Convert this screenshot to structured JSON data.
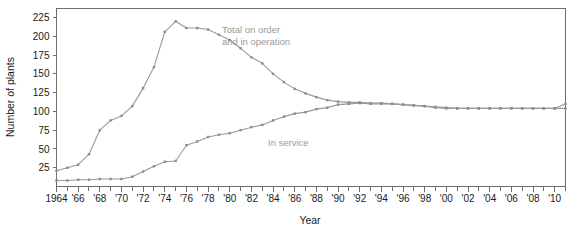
{
  "chart_data": {
    "type": "line",
    "title": "",
    "xlabel": "Year",
    "ylabel": "Number of plants",
    "xlim": [
      1964,
      2011
    ],
    "ylim": [
      0,
      237
    ],
    "grid": false,
    "legend_position": "inline-annotation",
    "y_ticks": [
      25,
      50,
      75,
      100,
      125,
      150,
      175,
      200,
      225
    ],
    "y_tick_labels": [
      "25",
      "50",
      "75",
      "100",
      "125",
      "150",
      "175",
      "200",
      "225"
    ],
    "x_ticks": [
      1964,
      1966,
      1968,
      1970,
      1972,
      1974,
      1976,
      1978,
      1980,
      1982,
      1984,
      1986,
      1988,
      1990,
      1992,
      1994,
      1996,
      1998,
      2000,
      2002,
      2004,
      2006,
      2008,
      2010
    ],
    "x_tick_labels": [
      "1964",
      "'66",
      "'68",
      "'70",
      "'72",
      "'74",
      "'76",
      "'78",
      "'80",
      "'82",
      "'84",
      "'86",
      "'88",
      "'90",
      "'92",
      "'94",
      "'96",
      "'98",
      "'00",
      "'02",
      "'04",
      "'06",
      "'08",
      "'10"
    ],
    "x_minor_ticks": [
      1965,
      1967,
      1969,
      1971,
      1973,
      1975,
      1977,
      1979,
      1981,
      1983,
      1985,
      1987,
      1989,
      1991,
      1993,
      1995,
      1997,
      1999,
      2001,
      2003,
      2005,
      2007,
      2009,
      2011
    ],
    "line_color": "#9a9a9a",
    "marker_color": "#8d8d8d",
    "axis_color": "#6e6e6e",
    "text_color": "#1a1a1a",
    "annotation_color": "#9a9a9a",
    "series": [
      {
        "name": "Total on order and in operation",
        "annotation": "Total on order\nand in operation",
        "annotation_line1": "Total on order",
        "annotation_line2": "and in operation",
        "x": [
          1964,
          1965,
          1966,
          1967,
          1968,
          1969,
          1970,
          1971,
          1972,
          1973,
          1974,
          1975,
          1976,
          1977,
          1978,
          1979,
          1980,
          1981,
          1982,
          1983,
          1984,
          1985,
          1986,
          1987,
          1988,
          1989,
          1990,
          1991,
          1992,
          1993,
          1994,
          1995,
          1996,
          1997,
          1998,
          1999,
          2000,
          2001,
          2002,
          2003,
          2004,
          2005,
          2006,
          2007,
          2008,
          2009,
          2010,
          2011
        ],
        "values": [
          21,
          25,
          29,
          43,
          75,
          88,
          94,
          107,
          131,
          159,
          206,
          220,
          211,
          211,
          209,
          202,
          195,
          184,
          172,
          164,
          150,
          139,
          130,
          124,
          119,
          115,
          113,
          112,
          112,
          111,
          111,
          110,
          109,
          108,
          107,
          106,
          105,
          104,
          104,
          104,
          104,
          104,
          104,
          104,
          104,
          104,
          104,
          110
        ]
      },
      {
        "name": "In service",
        "annotation": "In service",
        "x": [
          1964,
          1965,
          1966,
          1967,
          1968,
          1969,
          1970,
          1971,
          1972,
          1973,
          1974,
          1975,
          1976,
          1977,
          1978,
          1979,
          1980,
          1981,
          1982,
          1983,
          1984,
          1985,
          1986,
          1987,
          1988,
          1989,
          1990,
          1991,
          1992,
          1993,
          1994,
          1995,
          1996,
          1997,
          1998,
          1999,
          2000,
          2001,
          2002,
          2003,
          2004,
          2005,
          2006,
          2007,
          2008,
          2009,
          2010,
          2011
        ],
        "values": [
          8,
          8,
          9,
          9,
          10,
          10,
          10,
          13,
          20,
          27,
          33,
          34,
          55,
          60,
          66,
          69,
          71,
          75,
          79,
          82,
          88,
          93,
          97,
          99,
          103,
          105,
          109,
          110,
          111,
          110,
          110,
          110,
          109,
          108,
          107,
          105,
          104,
          104,
          104,
          104,
          104,
          104,
          104,
          104,
          104,
          104,
          104,
          104
        ]
      }
    ]
  }
}
